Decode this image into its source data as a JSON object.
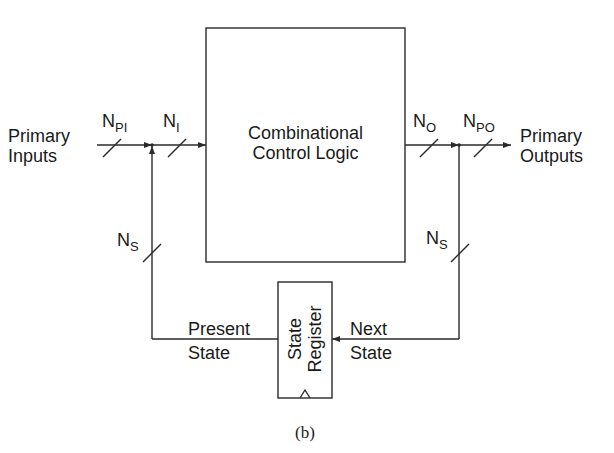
{
  "diagram": {
    "type": "finite-state-machine-block-diagram",
    "caption": "(b)",
    "blocks": {
      "combinational_logic": {
        "line1": "Combinational",
        "line2": "Control Logic"
      },
      "state_register": {
        "line1": "State",
        "line2": "Register"
      }
    },
    "signals": {
      "primary_inputs": {
        "line1": "Primary",
        "line2": "Inputs"
      },
      "primary_outputs": {
        "line1": "Primary",
        "line2": "Outputs"
      },
      "present_state": {
        "line1": "Present",
        "line2": "State"
      },
      "next_state": {
        "line1": "Next",
        "line2": "State"
      }
    },
    "bus_widths": {
      "n_pi": {
        "base": "N",
        "sub": "PI"
      },
      "n_i": {
        "base": "N",
        "sub": "I"
      },
      "n_o": {
        "base": "N",
        "sub": "O"
      },
      "n_po": {
        "base": "N",
        "sub": "PO"
      },
      "n_s_left": {
        "base": "N",
        "sub": "S"
      },
      "n_s_right": {
        "base": "N",
        "sub": "S"
      }
    },
    "colors": {
      "stroke": "#2a2a2a",
      "background": "#ffffff"
    }
  }
}
